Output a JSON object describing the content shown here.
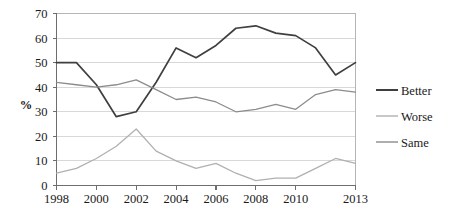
{
  "chart_data": {
    "type": "line",
    "title": "",
    "xlabel": "",
    "ylabel": "%",
    "ylim": [
      0,
      70
    ],
    "ytick_step": 10,
    "yticks": [
      "0",
      "10",
      "20",
      "30",
      "40",
      "50",
      "60",
      "70"
    ],
    "grid": "horizontal",
    "legend_position": "right",
    "x": [
      1998,
      1999,
      2000,
      2001,
      2002,
      2003,
      2004,
      2005,
      2006,
      2007,
      2008,
      2009,
      2010,
      2011,
      2012,
      2013
    ],
    "xtick_labels": [
      "1998",
      "2000",
      "2002",
      "2004",
      "2006",
      "2008",
      "2010",
      "2013"
    ],
    "xtick_values": [
      1998,
      2000,
      2002,
      2004,
      2006,
      2008,
      2010,
      2013
    ],
    "series": [
      {
        "name": "Better",
        "color": "#3f3f3f",
        "values": [
          50,
          50,
          41,
          28,
          30,
          42,
          56,
          52,
          57,
          64,
          65,
          62,
          61,
          56,
          45,
          50
        ]
      },
      {
        "name": "Worse",
        "color": "#b0b0b0",
        "values": [
          5,
          7,
          11,
          16,
          23,
          14,
          10,
          7,
          9,
          5,
          2,
          3,
          3,
          7,
          11,
          9
        ]
      },
      {
        "name": "Same",
        "color": "#8c8c8c",
        "values": [
          42,
          41,
          40,
          41,
          43,
          39,
          35,
          36,
          34,
          30,
          31,
          33,
          31,
          37,
          39,
          38
        ]
      }
    ]
  },
  "legend": {
    "items": [
      {
        "label": "Better",
        "color": "#3f3f3f"
      },
      {
        "label": "Worse",
        "color": "#b0b0b0"
      },
      {
        "label": "Same",
        "color": "#8c8c8c"
      }
    ]
  },
  "axis": {
    "y_label": "%"
  }
}
